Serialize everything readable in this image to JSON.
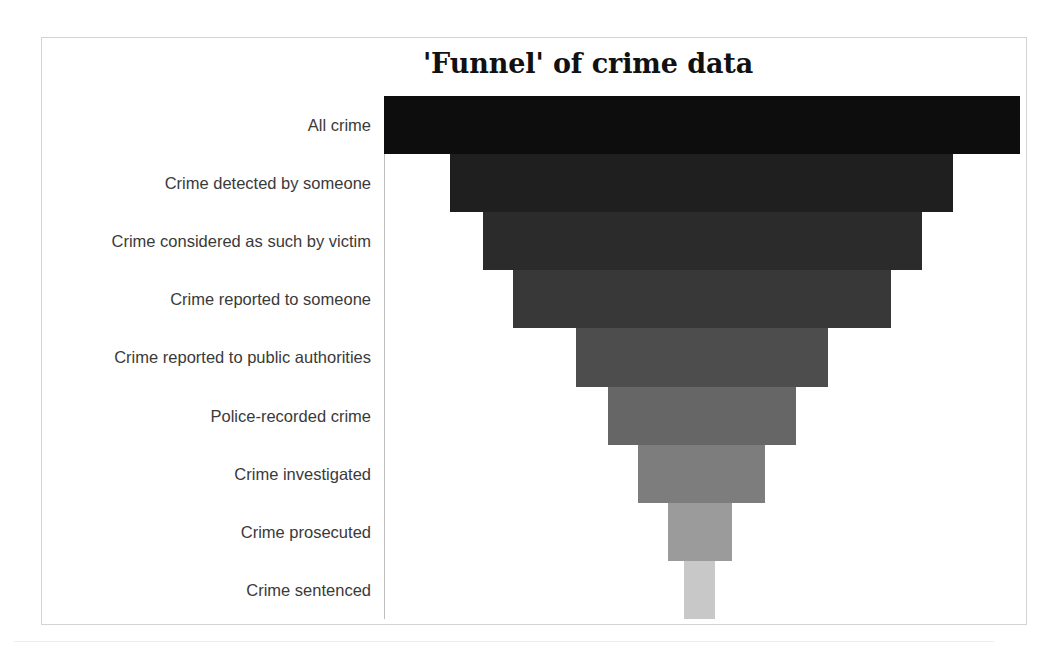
{
  "chart": {
    "title": "'Funnel' of crime data",
    "frame_border_color": "#d3d3d3",
    "axis_line_color": "#bfbfbf",
    "background_color": "#ffffff",
    "label_color": "#3a3a3a"
  },
  "chart_data": {
    "type": "bar",
    "title": "'Funnel' of crime data",
    "subtitle": "",
    "xlabel": "",
    "ylabel": "",
    "orientation": "horizontal-funnel",
    "grid": false,
    "legend": "none",
    "axis_line": "left vertical category axis",
    "categories": [
      "All crime",
      "Crime detected by someone",
      "Crime considered as such by victim",
      "Crime reported to someone",
      "Crime reported to public authorities",
      "Police-recorded crime",
      "Crime investigated",
      "Crime prosecuted",
      "Crime sentenced"
    ],
    "values": [
      100,
      79,
      69,
      59,
      40,
      30,
      20,
      10,
      5
    ],
    "value_unit": "relative width (%)",
    "colors": [
      "#0d0d0d",
      "#1f1f1f",
      "#2b2b2b",
      "#383838",
      "#4d4d4d",
      "#666666",
      "#7d7d7d",
      "#9b9b9b",
      "#c8c8c8"
    ],
    "bars": [
      {
        "label": "All crime",
        "left": 383,
        "right": 1019,
        "value": 100,
        "color": "#0d0d0d"
      },
      {
        "label": "Crime detected by someone",
        "left": 449,
        "right": 952,
        "value": 79,
        "color": "#1f1f1f"
      },
      {
        "label": "Crime considered as such by victim",
        "left": 482,
        "right": 921,
        "value": 69,
        "color": "#2b2b2b"
      },
      {
        "label": "Crime reported to someone",
        "left": 512,
        "right": 890,
        "value": 59,
        "color": "#383838"
      },
      {
        "label": "Crime reported to public authorities",
        "left": 575,
        "right": 827,
        "value": 40,
        "color": "#4d4d4d"
      },
      {
        "label": "Police-recorded crime",
        "left": 607,
        "right": 795,
        "value": 30,
        "color": "#666666"
      },
      {
        "label": "Crime investigated",
        "left": 637,
        "right": 764,
        "value": 20,
        "color": "#7d7d7d"
      },
      {
        "label": "Crime prosecuted",
        "left": 667,
        "right": 731,
        "value": 10,
        "color": "#9b9b9b"
      },
      {
        "label": "Crime sentenced",
        "left": 683,
        "right": 714,
        "value": 5,
        "color": "#c8c8c8"
      }
    ]
  }
}
